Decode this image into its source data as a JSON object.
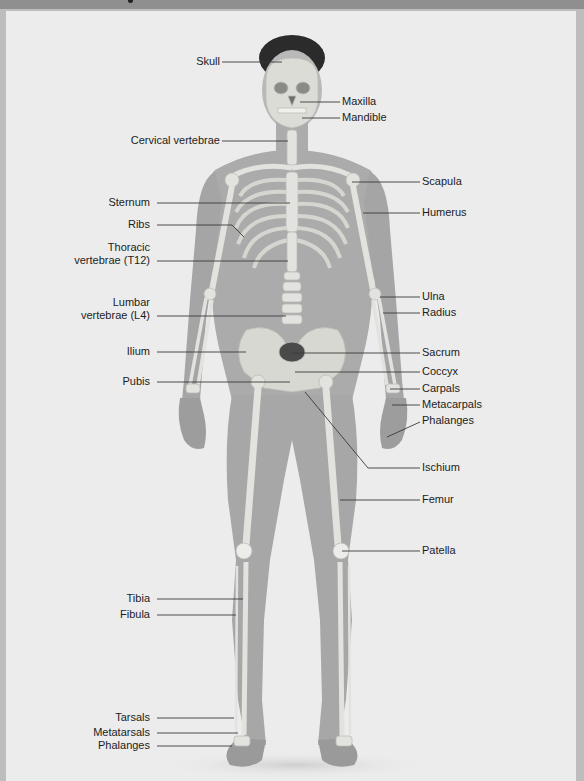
{
  "figure": {
    "type": "anatomy-diagram",
    "colors": {
      "background": "#ececec",
      "frame": "#bdbdbd",
      "header_bar": "#8f8f8f",
      "body": "#a9a9a9",
      "bone": "#e4e4e0",
      "leader_line": "#3a3a3a",
      "label_text": "#1c1c1c"
    }
  },
  "labels": {
    "left": [
      {
        "id": "skull",
        "text": "Skull"
      },
      {
        "id": "cervical",
        "text": "Cervical vertebrae"
      },
      {
        "id": "sternum",
        "text": "Sternum"
      },
      {
        "id": "ribs",
        "text": "Ribs"
      },
      {
        "id": "thoracic_1",
        "text": "Thoracic"
      },
      {
        "id": "thoracic_2",
        "text": "vertebrae (T12)"
      },
      {
        "id": "lumbar_1",
        "text": "Lumbar"
      },
      {
        "id": "lumbar_2",
        "text": "vertebrae (L4)"
      },
      {
        "id": "ilium",
        "text": "Ilium"
      },
      {
        "id": "pubis",
        "text": "Pubis"
      },
      {
        "id": "tibia",
        "text": "Tibia"
      },
      {
        "id": "fibula",
        "text": "Fibula"
      },
      {
        "id": "tarsals",
        "text": "Tarsals"
      },
      {
        "id": "metatarsals",
        "text": "Metatarsals"
      },
      {
        "id": "phalanges_foot",
        "text": "Phalanges"
      }
    ],
    "right": [
      {
        "id": "maxilla",
        "text": "Maxilla"
      },
      {
        "id": "mandible",
        "text": "Mandible"
      },
      {
        "id": "scapula",
        "text": "Scapula"
      },
      {
        "id": "humerus",
        "text": "Humerus"
      },
      {
        "id": "ulna",
        "text": "Ulna"
      },
      {
        "id": "radius",
        "text": "Radius"
      },
      {
        "id": "sacrum",
        "text": "Sacrum"
      },
      {
        "id": "coccyx",
        "text": "Coccyx"
      },
      {
        "id": "carpals",
        "text": "Carpals"
      },
      {
        "id": "metacarpals",
        "text": "Metacarpals"
      },
      {
        "id": "phalanges_hand",
        "text": "Phalanges"
      },
      {
        "id": "ischium",
        "text": "Ischium"
      },
      {
        "id": "femur",
        "text": "Femur"
      },
      {
        "id": "patella",
        "text": "Patella"
      }
    ]
  }
}
